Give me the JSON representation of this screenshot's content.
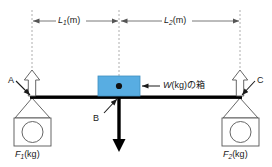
{
  "figure": {
    "colors": {
      "box_fill": "#58ade2",
      "box_stroke": "#3f8fc0",
      "beam": "#000000",
      "arrow_down": "#000000",
      "arrow_up_fill": "#ffffff",
      "arrow_up_stroke": "#555555",
      "dashed_guide": "#999999",
      "dimension_line": "#555555",
      "weight_stroke": "#555555",
      "background": "#ffffff",
      "text": "#1a1a1a"
    }
  },
  "dimensions": {
    "left": {
      "symbol": "L",
      "subscript": "1",
      "unit": "(m)",
      "text": "L1(m)"
    },
    "right": {
      "symbol": "L",
      "subscript": "2",
      "unit": "(m)",
      "text": "L2(m)"
    }
  },
  "points": {
    "a": "A",
    "b": "B",
    "c": "C"
  },
  "load": {
    "symbol": "W",
    "unit": "(kg)",
    "suffix": "の箱",
    "text": "W(kg) の箱"
  },
  "forces": {
    "left": {
      "symbol": "F",
      "subscript": "1",
      "unit": "(kg)",
      "text": "F1(kg)"
    },
    "right": {
      "symbol": "F",
      "subscript": "2",
      "unit": "(kg)",
      "text": "F2(kg)"
    }
  },
  "icons": {
    "up_arrow_left": "up-arrow-icon",
    "up_arrow_right": "up-arrow-icon",
    "down_arrow": "down-arrow-icon",
    "dimension_arrow_left": "left-arrow-icon",
    "dimension_arrow_right": "right-arrow-icon",
    "pointer_a": "leader-line-icon",
    "pointer_b": "leader-line-icon",
    "pointer_c": "leader-line-icon",
    "pointer_load": "leader-arrow-icon",
    "pivot": "pivot-dot-icon"
  }
}
